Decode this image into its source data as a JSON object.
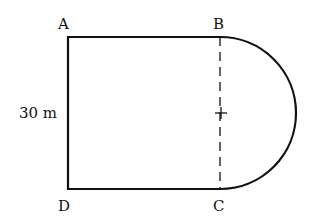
{
  "diagram": {
    "labels": {
      "A": "A",
      "B": "B",
      "C": "C",
      "D": "D"
    },
    "dimension": "30 m",
    "colors": {
      "stroke": "#111111",
      "background": "#ffffff"
    }
  }
}
